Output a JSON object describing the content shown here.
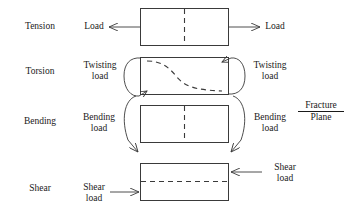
{
  "figure": {
    "stroke_color": "#3a3a3a",
    "text_color": "#1a1a1a",
    "background": "#ffffff"
  },
  "annotation": {
    "fracture_plane_numerator": "Fracture",
    "fracture_plane_denominator": "Plane"
  },
  "rows": [
    {
      "name": "tension",
      "row_label": "Tension",
      "left_label": "Load",
      "right_label": "Load",
      "fracture_plane_orientation": "vertical-center"
    },
    {
      "name": "torsion",
      "row_label": "Torsion",
      "left_label": "Twisting\nload",
      "left_label_line1": "Twisting",
      "left_label_line2": "load",
      "right_label_line1": "Twisting",
      "right_label_line2": "load",
      "fracture_plane_orientation": "helical-s-curve"
    },
    {
      "name": "bending",
      "row_label": "Bending",
      "left_label_line1": "Bending",
      "left_label_line2": "load",
      "right_label_line1": "Bending",
      "right_label_line2": "load",
      "fracture_plane_orientation": "vertical-center"
    },
    {
      "name": "shear",
      "row_label": "Shear",
      "left_label_line1": "Shear",
      "left_label_line2": "load",
      "right_label_line1": "Shear",
      "right_label_line2": "load",
      "fracture_plane_orientation": "horizontal-center"
    }
  ]
}
